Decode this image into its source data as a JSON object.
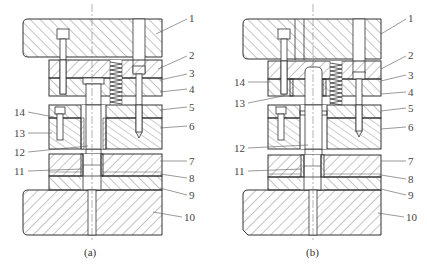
{
  "figure": {
    "colors": {
      "line": "#333333",
      "hatch": "#555555",
      "background": "#ffffff",
      "label": "#444444"
    }
  },
  "subfigures": [
    {
      "id": "a",
      "caption": "(a)"
    },
    {
      "id": "b",
      "caption": "(b)"
    }
  ],
  "labels_right": [
    "1",
    "2",
    "3",
    "4",
    "5",
    "6",
    "7",
    "8",
    "9",
    "10"
  ],
  "labels_left_a": [
    "14",
    "13",
    "12",
    "11"
  ],
  "labels_left_b": [
    "14",
    "13",
    "12",
    "11"
  ]
}
